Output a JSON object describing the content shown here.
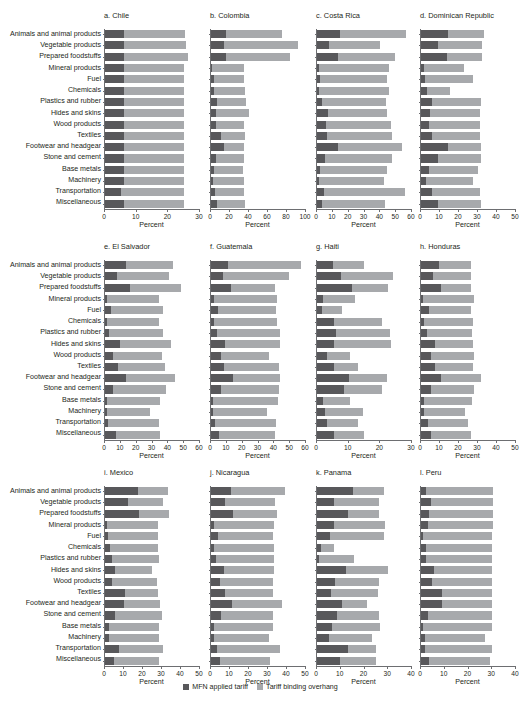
{
  "figure": {
    "categories": [
      "Animals and animal products",
      "Vegetable products",
      "Prepared foodstuffs",
      "Mineral products",
      "Fuel",
      "Chemicals",
      "Plastics and rubber",
      "Hides and skins",
      "Wood products",
      "Textiles",
      "Footwear and headgear",
      "Stone and cement",
      "Base metals",
      "Machinery",
      "Transportation",
      "Miscellaneous"
    ],
    "xlabel": "Percent",
    "legend": {
      "mfn_label": "MFN applied tariff",
      "overhang_label": "Tariff binding overhang",
      "mfn_color": "#58585b",
      "overhang_color": "#a7a9ac"
    }
  },
  "chart_data": {
    "type": "bar",
    "title": "",
    "xlabel": "Percent",
    "ylabel": "",
    "orientation": "horizontal",
    "stacked": true,
    "grid": false,
    "legend_position": "bottom-center",
    "categories": [
      "Animals and animal products",
      "Vegetable products",
      "Prepared foodstuffs",
      "Mineral products",
      "Fuel",
      "Chemicals",
      "Plastics and rubber",
      "Hides and skins",
      "Wood products",
      "Textiles",
      "Footwear and headgear",
      "Stone and cement",
      "Base metals",
      "Machinery",
      "Transportation",
      "Miscellaneous"
    ],
    "series_names": [
      "MFN applied tariff",
      "Tariff binding overhang"
    ],
    "panels": [
      {
        "key": "chile",
        "title": "a. Chile",
        "xlim": [
          0,
          30
        ],
        "xticks": [
          0,
          10,
          20,
          30
        ],
        "mfn": [
          6.0,
          6.0,
          6.0,
          6.0,
          6.0,
          6.0,
          6.0,
          6.0,
          6.0,
          6.0,
          6.0,
          6.0,
          6.0,
          6.0,
          5.0,
          6.0
        ],
        "overhang": [
          19.4,
          19.5,
          20.2,
          19.0,
          19.0,
          19.0,
          19.0,
          19.0,
          19.0,
          19.0,
          19.0,
          19.0,
          19.0,
          19.0,
          20.0,
          19.0
        ]
      },
      {
        "key": "colombia",
        "title": "b. Colombia",
        "xlim": [
          0,
          100
        ],
        "xticks": [
          0,
          20,
          40,
          60,
          80,
          100
        ],
        "mfn": [
          16.0,
          14.0,
          16.0,
          1.5,
          3.0,
          3.0,
          6.0,
          5.0,
          5.0,
          11.0,
          13.5,
          5.0,
          3.0,
          2.0,
          4.5,
          6.5
        ],
        "overhang": [
          59.0,
          78.0,
          67.0,
          33.0,
          32.0,
          33.0,
          31.0,
          35.0,
          30.0,
          25.0,
          21.5,
          30.0,
          31.0,
          33.0,
          30.0,
          29.5
        ]
      },
      {
        "key": "costa-rica",
        "title": "c. Costa Rica",
        "xlim": [
          0,
          60
        ],
        "xticks": [
          0,
          10,
          20,
          30,
          40,
          50,
          60
        ],
        "mfn": [
          14.5,
          7.5,
          13.5,
          1.5,
          2.0,
          1.5,
          3.0,
          7.0,
          5.5,
          6.5,
          13.5,
          5.0,
          2.0,
          1.5,
          4.5,
          3.0
        ],
        "overhang": [
          41.5,
          32.0,
          36.0,
          44.0,
          42.5,
          44.0,
          40.5,
          37.5,
          41.5,
          41.0,
          40.0,
          42.5,
          42.5,
          40.5,
          51.0,
          40.0
        ]
      },
      {
        "key": "dominican-republic",
        "title": "d. Dominican Republic",
        "xlim": [
          0,
          50
        ],
        "xticks": [
          0,
          10,
          20,
          30,
          40,
          50
        ],
        "mfn": [
          14.0,
          9.0,
          13.5,
          1.5,
          2.0,
          3.0,
          6.0,
          4.5,
          4.0,
          6.0,
          14.0,
          9.0,
          4.0,
          2.5,
          6.0,
          9.0
        ],
        "overhang": [
          19.0,
          23.0,
          18.5,
          21.0,
          25.5,
          12.5,
          25.5,
          26.5,
          27.0,
          25.0,
          17.5,
          22.5,
          26.0,
          25.0,
          25.0,
          22.5
        ]
      },
      {
        "key": "el-salvador",
        "title": "e. El Salvador",
        "xlim": [
          0,
          60
        ],
        "xticks": [
          0,
          10,
          20,
          30,
          40,
          50,
          60
        ],
        "mfn": [
          13.5,
          7.5,
          16.0,
          1.5,
          3.5,
          1.5,
          2.5,
          9.5,
          5.0,
          8.0,
          13.0,
          5.0,
          1.5,
          1.5,
          2.0,
          7.0
        ],
        "overhang": [
          29.5,
          33.0,
          32.0,
          32.5,
          33.0,
          32.5,
          34.0,
          32.0,
          31.0,
          30.0,
          31.0,
          33.5,
          33.0,
          27.0,
          32.0,
          28.0
        ]
      },
      {
        "key": "guatemala",
        "title": "f. Guatemala",
        "xlim": [
          0,
          60
        ],
        "xticks": [
          0,
          10,
          20,
          30,
          40,
          50,
          60
        ],
        "mfn": [
          11.0,
          7.5,
          12.5,
          2.0,
          4.5,
          2.0,
          3.5,
          9.0,
          6.0,
          8.5,
          14.0,
          6.0,
          1.5,
          1.5,
          2.5,
          5.0
        ],
        "overhang": [
          46.0,
          41.5,
          28.0,
          40.0,
          36.5,
          39.5,
          40.0,
          34.5,
          30.5,
          34.5,
          29.5,
          37.0,
          40.5,
          34.0,
          38.5,
          35.5
        ]
      },
      {
        "key": "haiti",
        "title": "g. Haiti",
        "xlim": [
          0,
          30
        ],
        "xticks": [
          0,
          10,
          20,
          30
        ],
        "mfn": [
          5.0,
          7.5,
          11.0,
          2.0,
          1.5,
          5.5,
          6.0,
          5.5,
          3.0,
          5.5,
          10.0,
          8.5,
          2.0,
          2.5,
          3.0,
          5.5
        ],
        "overhang": [
          10.0,
          16.5,
          11.5,
          10.0,
          6.5,
          15.0,
          17.0,
          18.0,
          7.5,
          7.5,
          12.0,
          12.0,
          8.5,
          12.0,
          10.0,
          9.5
        ]
      },
      {
        "key": "honduras",
        "title": "h. Honduras",
        "xlim": [
          0,
          50
        ],
        "xticks": [
          0,
          10,
          20,
          30,
          40,
          50
        ],
        "mfn": [
          9.5,
          6.5,
          10.5,
          1.0,
          4.0,
          1.5,
          3.0,
          7.5,
          5.0,
          7.5,
          10.5,
          5.0,
          1.5,
          1.5,
          3.5,
          5.0
        ],
        "overhang": [
          17.0,
          20.0,
          16.0,
          27.0,
          22.5,
          26.0,
          24.0,
          20.0,
          23.0,
          20.0,
          21.0,
          23.0,
          25.5,
          21.5,
          21.0,
          21.5
        ]
      },
      {
        "key": "mexico",
        "title": "i. Mexico",
        "xlim": [
          0,
          50
        ],
        "xticks": [
          0,
          10,
          20,
          30,
          40,
          50
        ],
        "mfn": [
          17.5,
          12.0,
          18.0,
          1.0,
          1.5,
          2.5,
          3.5,
          5.5,
          3.5,
          10.5,
          10.0,
          5.0,
          2.0,
          2.0,
          7.5,
          4.5
        ],
        "overhang": [
          15.5,
          18.5,
          15.5,
          27.0,
          26.5,
          25.5,
          25.0,
          19.0,
          24.0,
          17.5,
          19.0,
          25.0,
          26.5,
          26.5,
          23.0,
          24.0
        ]
      },
      {
        "key": "nicaragua",
        "title": "j. Nicaragua",
        "xlim": [
          0,
          50
        ],
        "xticks": [
          0,
          10,
          20,
          30,
          40,
          50
        ],
        "mfn": [
          10.5,
          7.5,
          11.5,
          1.5,
          3.5,
          1.5,
          2.5,
          7.0,
          4.5,
          7.5,
          11.0,
          5.0,
          1.5,
          1.5,
          3.0,
          4.5
        ],
        "overhang": [
          28.5,
          26.0,
          23.0,
          31.5,
          29.0,
          31.5,
          30.5,
          26.0,
          28.0,
          25.0,
          26.5,
          27.5,
          31.0,
          29.0,
          33.5,
          26.5
        ]
      },
      {
        "key": "panama",
        "title": "k. Panama",
        "xlim": [
          0,
          40
        ],
        "xticks": [
          0,
          10,
          20,
          30,
          40
        ],
        "mfn": [
          15.0,
          7.0,
          13.0,
          7.0,
          5.5,
          1.5,
          1.0,
          12.0,
          7.5,
          6.0,
          10.5,
          8.5,
          6.5,
          5.0,
          13.0,
          9.5
        ],
        "overhang": [
          13.0,
          19.0,
          13.0,
          21.5,
          22.5,
          5.5,
          14.5,
          18.0,
          18.5,
          19.5,
          10.5,
          17.5,
          20.0,
          18.0,
          12.0,
          15.5
        ]
      },
      {
        "key": "peru",
        "title": "l. Peru",
        "xlim": [
          0,
          40
        ],
        "xticks": [
          0,
          10,
          20,
          30,
          40
        ],
        "mfn": [
          2.0,
          4.0,
          3.5,
          3.0,
          1.0,
          2.0,
          2.0,
          5.5,
          4.5,
          9.0,
          9.0,
          3.0,
          1.0,
          1.5,
          1.5,
          3.5
        ],
        "overhang": [
          28.5,
          26.5,
          27.0,
          27.5,
          29.0,
          28.0,
          28.0,
          24.5,
          25.5,
          21.0,
          21.0,
          27.0,
          29.0,
          25.5,
          28.5,
          25.5
        ]
      }
    ]
  }
}
